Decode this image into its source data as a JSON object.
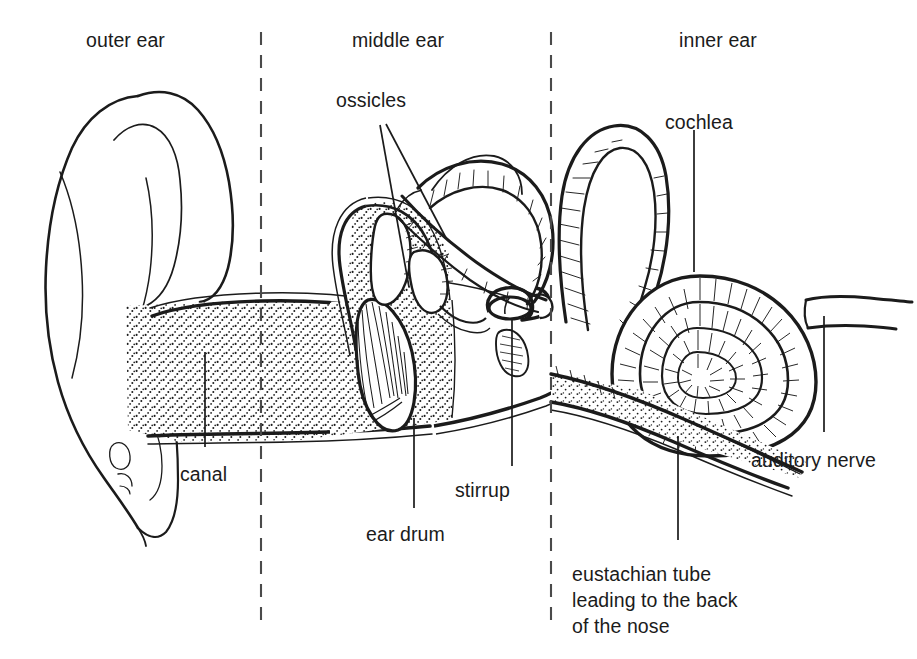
{
  "diagram": {
    "type": "labelled cross-section illustration",
    "style": "black ink line drawing with stipple and hatch shading on white",
    "colors": {
      "ink": "#1b1b1b",
      "background": "#ffffff",
      "stipple": "#1b1b1b"
    },
    "region_labels": [
      {
        "id": "outer-ear",
        "text": "outer ear",
        "x": 86,
        "y": 28
      },
      {
        "id": "middle-ear",
        "text": "middle ear",
        "x": 352,
        "y": 28
      },
      {
        "id": "inner-ear",
        "text": "inner ear",
        "x": 679,
        "y": 28
      }
    ],
    "part_labels": [
      {
        "id": "ossicles",
        "text": "ossicles",
        "x": 336,
        "y": 88,
        "align": "left"
      },
      {
        "id": "cochlea",
        "text": "cochlea",
        "x": 665,
        "y": 110,
        "align": "left"
      },
      {
        "id": "canal",
        "text": "canal",
        "x": 180,
        "y": 462,
        "align": "left"
      },
      {
        "id": "ear-drum",
        "text": "ear drum",
        "x": 366,
        "y": 522,
        "align": "left"
      },
      {
        "id": "stirrup",
        "text": "stirrup",
        "x": 455,
        "y": 478,
        "align": "left"
      },
      {
        "id": "auditory-nerve",
        "text": "auditory nerve",
        "x": 751,
        "y": 448,
        "align": "left"
      }
    ],
    "multiline_labels": [
      {
        "id": "eustachian-tube",
        "lines": [
          "eustachian tube",
          "leading to the back",
          "of the nose"
        ],
        "x": 572,
        "y": 562
      }
    ],
    "dividers": [
      {
        "id": "outer-middle-divider",
        "x": 261,
        "y1": 32,
        "y2": 620,
        "style": "dashed"
      },
      {
        "id": "middle-inner-divider",
        "x": 551,
        "y1": 32,
        "y2": 620,
        "style": "dashed"
      }
    ],
    "leader_lines": [
      {
        "for": "ossicles",
        "from": [
          380,
          125
        ],
        "to": [
          409,
          287
        ]
      },
      {
        "for": "ossicles",
        "from": [
          386,
          124
        ],
        "to": [
          446,
          238
        ]
      },
      {
        "for": "cochlea",
        "from": [
          694,
          130
        ],
        "to": [
          694,
          272
        ]
      },
      {
        "for": "canal",
        "from": [
          205,
          352
        ],
        "to": [
          205,
          447
        ]
      },
      {
        "for": "ear-drum",
        "from": [
          414,
          508
        ],
        "to": [
          414,
          418
        ]
      },
      {
        "for": "stirrup",
        "from": [
          512,
          466
        ],
        "to": [
          512,
          320
        ]
      },
      {
        "for": "auditory-nerve",
        "from": [
          824,
          432
        ],
        "to": [
          824,
          316
        ]
      }
    ],
    "parts_depicted": [
      "pinna (auricle)",
      "ear canal",
      "ear drum (tympanic membrane)",
      "ossicles (hammer and anvil)",
      "stirrup (stapes)",
      "semicircular canals",
      "cochlea",
      "auditory nerve",
      "eustachian tube"
    ]
  }
}
